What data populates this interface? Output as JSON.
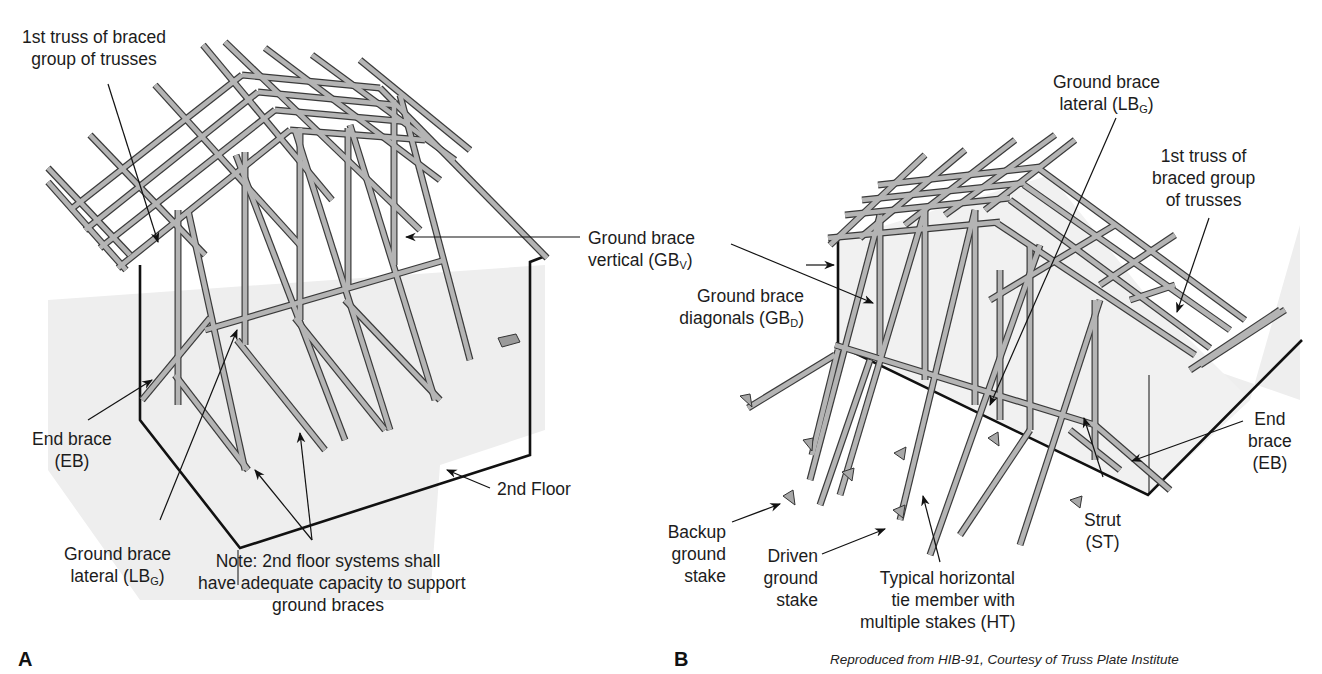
{
  "figure": {
    "panels": [
      {
        "letter": "A",
        "labels": {
          "first_truss": [
            "1st truss of braced",
            "group of trusses"
          ],
          "ground_brace_vertical": [
            "Ground brace",
            "vertical (GB",
            "V",
            ")"
          ],
          "end_brace": [
            "End brace",
            "(EB)"
          ],
          "second_floor": "2nd Floor",
          "ground_brace_lateral": [
            "Ground brace",
            "lateral (LB",
            "G",
            ")"
          ],
          "note": [
            "Note: 2nd floor systems shall",
            "have adequate capacity to support",
            "ground braces"
          ]
        }
      },
      {
        "letter": "B",
        "labels": {
          "ground_brace_lateral": [
            "Ground brace",
            "lateral (LB",
            "G",
            ")"
          ],
          "first_truss": [
            "1st truss of",
            "braced group",
            "of trusses"
          ],
          "ground_brace_diagonals": [
            "Ground brace",
            "diagonals (GB",
            "D",
            ")"
          ],
          "end_brace": [
            "End",
            "brace",
            "(EB)"
          ],
          "strut": [
            "Strut",
            "(ST)"
          ],
          "backup_stake": [
            "Backup",
            "ground",
            "stake"
          ],
          "driven_stake": [
            "Driven",
            "ground",
            "stake"
          ],
          "horizontal_tie": [
            "Typical horizontal",
            "tie member with",
            "multiple stakes (HT)"
          ]
        }
      }
    ],
    "credit": "Reproduced from HIB-91, Courtesy of Truss Plate Institute",
    "colors": {
      "lumber_fill": "#b4b4b4",
      "lumber_edge": "#3a3a3a",
      "shadow_gray": "#ececec",
      "line": "#111111",
      "background": "#ffffff"
    }
  }
}
